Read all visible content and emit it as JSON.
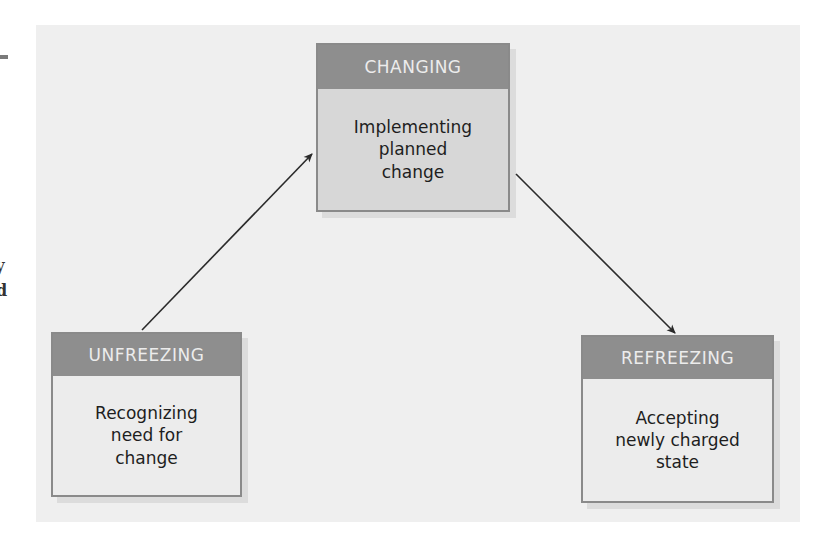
{
  "margin": {
    "char_1": "y",
    "char_2": "d"
  },
  "colors": {
    "panel_background": "#efefef",
    "header_background": "#8e8e8e",
    "header_text": "#ececec",
    "changing_body": "#d7d7d7",
    "stage_body": "#ececec",
    "arrow": "#2a2a2a"
  },
  "diagram": {
    "stages": [
      {
        "id": "unfreezing",
        "title": "UNFREEZING",
        "description": "Recognizing\nneed for\nchange"
      },
      {
        "id": "changing",
        "title": "CHANGING",
        "description": "Implementing\nplanned\nchange"
      },
      {
        "id": "refreezing",
        "title": "REFREEZING",
        "description": "Accepting\nnewly charged\nstate"
      }
    ],
    "arrows": [
      {
        "from": "unfreezing",
        "to": "changing"
      },
      {
        "from": "changing",
        "to": "refreezing"
      }
    ]
  }
}
